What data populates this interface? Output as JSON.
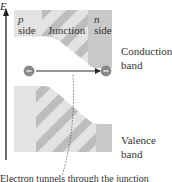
{
  "axis": {
    "label": "E"
  },
  "regions": {
    "p": {
      "letter": "p",
      "word": "side"
    },
    "junction": "Junction",
    "n": {
      "letter": "n",
      "word": "side"
    }
  },
  "bands": {
    "conduction": [
      "Conduction",
      "band"
    ],
    "valence": [
      "Valence",
      "band"
    ]
  },
  "caption_partial": "Electron tunnels through the junction",
  "colors": {
    "band_light": "#e3e3e3",
    "band_dark": "#c8c8c8",
    "stripe": "#b9b9b9",
    "n_side": "#c9c9c9",
    "electron": "#8a8a8a",
    "arrow": "#2a2a2a"
  }
}
